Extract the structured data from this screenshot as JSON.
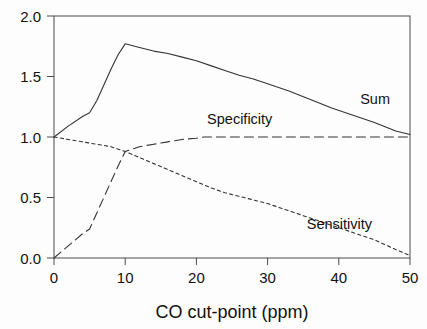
{
  "chart_data": {
    "type": "line",
    "title": "",
    "xlabel": "CO cut-point (ppm)",
    "ylabel": "",
    "xlim": [
      0,
      50
    ],
    "ylim": [
      0.0,
      2.0
    ],
    "xticks": [
      "0",
      "10",
      "20",
      "30",
      "40",
      "50"
    ],
    "xtick_values": [
      0,
      10,
      20,
      30,
      40,
      50
    ],
    "yticks": [
      "0.0",
      "0.5",
      "1.0",
      "1.5",
      "2.0"
    ],
    "ytick_values": [
      0.0,
      0.5,
      1.0,
      1.5,
      2.0
    ],
    "grid": false,
    "legend": "inline-labels",
    "series": [
      {
        "name": "Sum",
        "style": "solid",
        "label_position": {
          "x": 43.0,
          "y": 1.27
        },
        "x": [
          0,
          2,
          4,
          5,
          6,
          7,
          8,
          9,
          10,
          12,
          14,
          16,
          18,
          20,
          22,
          24,
          26,
          28,
          30,
          33,
          36,
          39,
          42,
          45,
          48,
          50
        ],
        "values": [
          1.0,
          1.09,
          1.17,
          1.2,
          1.3,
          1.43,
          1.56,
          1.68,
          1.77,
          1.74,
          1.71,
          1.69,
          1.66,
          1.63,
          1.59,
          1.55,
          1.51,
          1.48,
          1.44,
          1.38,
          1.31,
          1.24,
          1.18,
          1.12,
          1.05,
          1.02
        ]
      },
      {
        "name": "Specificity",
        "style": "long-dash",
        "label_position": {
          "x": 21.5,
          "y": 1.11
        },
        "x": [
          0,
          1,
          2,
          3,
          4,
          5,
          6,
          7,
          8,
          9,
          10,
          12,
          14,
          16,
          18,
          20,
          21,
          24,
          28,
          32,
          36,
          40,
          44,
          47,
          50
        ],
        "values": [
          0.0,
          0.05,
          0.1,
          0.15,
          0.2,
          0.24,
          0.37,
          0.5,
          0.63,
          0.76,
          0.88,
          0.92,
          0.94,
          0.96,
          0.98,
          0.99,
          1.0,
          1.0,
          1.0,
          1.0,
          1.0,
          1.0,
          1.0,
          1.0,
          1.0
        ]
      },
      {
        "name": "Sensitivity",
        "style": "short-dash",
        "label_position": {
          "x": 35.5,
          "y": 0.24
        },
        "x": [
          0,
          2,
          4,
          6,
          8,
          10,
          12,
          14,
          16,
          18,
          20,
          22,
          24,
          26,
          28,
          30,
          33,
          36,
          39,
          42,
          45,
          48,
          50
        ],
        "values": [
          1.0,
          0.98,
          0.96,
          0.94,
          0.92,
          0.88,
          0.83,
          0.78,
          0.73,
          0.68,
          0.63,
          0.58,
          0.54,
          0.51,
          0.48,
          0.45,
          0.39,
          0.33,
          0.27,
          0.21,
          0.15,
          0.07,
          0.02
        ]
      }
    ]
  }
}
